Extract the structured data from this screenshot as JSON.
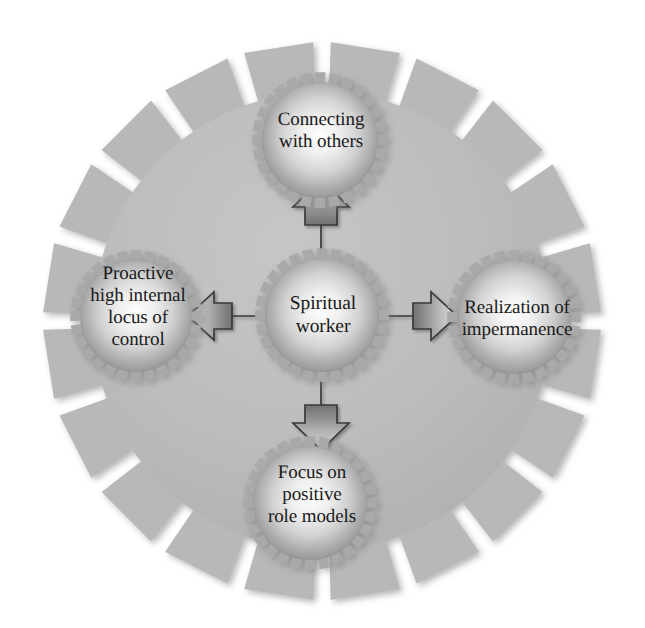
{
  "diagram": {
    "type": "gear-network",
    "background_color": "#ffffff",
    "big_gear": {
      "name": "background-gear",
      "center": [
        322,
        321
      ],
      "teeth": 20,
      "outer_radius": 279,
      "body_radius": 228,
      "fill_color": "#b9b9b9",
      "shade_color": "#a8a8a8"
    },
    "center_node": {
      "label": "Spiritual\nworker",
      "line1": "Spiritual",
      "line2": "worker",
      "center": [
        322,
        315
      ],
      "teeth": 28,
      "outer_radius": 67,
      "body_radius": 57,
      "fill_light": "#f3f3f3",
      "fill_dark": "#9a9a9a"
    },
    "satellites": [
      {
        "id": "connecting-with-others",
        "label": "Connecting\nwith others",
        "position": "top",
        "center": [
          320,
          140
        ],
        "teeth": 28,
        "outer_radius": 68,
        "body_radius": 58
      },
      {
        "id": "proactive-high-internal-locus-of-control",
        "label": "Proactive\nhigh internal\nlocus of\ncontrol",
        "position": "left",
        "center": [
          136,
          316
        ],
        "teeth": 28,
        "outer_radius": 66,
        "body_radius": 56
      },
      {
        "id": "realization-of-impermanence",
        "label": "Realization of\nimpermanence",
        "position": "right",
        "center": [
          514,
          317
        ],
        "teeth": 28,
        "outer_radius": 67,
        "body_radius": 57
      },
      {
        "id": "focus-on-positive-role-models",
        "label": "Focus on\npositive\nrole models",
        "position": "bottom",
        "center": [
          310,
          503
        ],
        "teeth": 28,
        "outer_radius": 67,
        "body_radius": 57
      }
    ],
    "arrows": [
      {
        "id": "arrow-up",
        "direction": "up",
        "from": "center_node",
        "to": "connecting-with-others"
      },
      {
        "id": "arrow-left",
        "direction": "left",
        "from": "center_node",
        "to": "proactive-high-internal-locus-of-control"
      },
      {
        "id": "arrow-right",
        "direction": "right",
        "from": "center_node",
        "to": "realization-of-impermanence"
      },
      {
        "id": "arrow-down",
        "direction": "down",
        "from": "center_node",
        "to": "focus-on-positive-role-models"
      }
    ],
    "colors": {
      "gear_base": "#b9b9b9",
      "gear_highlight": "#fcfcfc",
      "gear_shadow": "#8f8f8f",
      "arrow_outline": "#3a3a3a",
      "arrow_dark": "#4a4a4a",
      "arrow_light": "#d8d8d8",
      "text": "#1a1a1a",
      "page_background": "#ffffff"
    }
  }
}
